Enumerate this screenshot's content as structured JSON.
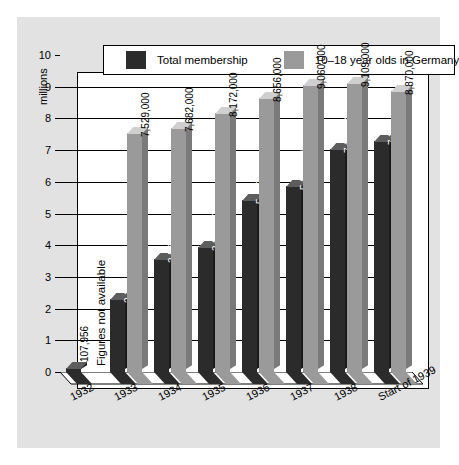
{
  "chart_data": {
    "type": "bar",
    "title": "",
    "subtitle": "",
    "xlabel": "",
    "ylabel": "millions",
    "ylim": [
      0,
      10
    ],
    "yticks": [
      0,
      1,
      2,
      3,
      4,
      5,
      6,
      7,
      8,
      9,
      10
    ],
    "ytick_labels": [
      "0",
      "1",
      "2",
      "3",
      "4",
      "5",
      "6",
      "7",
      "8",
      "9",
      "10"
    ],
    "grid": true,
    "legend_position": "top",
    "categories": [
      "1932",
      "1933",
      "1934",
      "1935",
      "1936",
      "1937",
      "1938",
      "Start of 1939"
    ],
    "series": [
      {
        "name": "Total  membership",
        "color": "#2b2b2b",
        "values": [
          107956,
          2292041,
          3577565,
          3943303,
          5437601,
          5879955,
          7031226,
          7287470
        ],
        "labels": [
          "107,956",
          "2,292,041",
          "3,577,565",
          "3,943,303",
          "5,437,601",
          "5,879,955",
          "7,031,226",
          "7,287,470"
        ]
      },
      {
        "name": "10–18 year olds in Germany",
        "color": "#9a9a9a",
        "values": [
          null,
          7529000,
          7682000,
          8172000,
          8656000,
          9060000,
          9109000,
          8870000
        ],
        "labels": [
          "",
          "7,529,000",
          "7,682,000",
          "8,172,000",
          "8,656,000",
          "9,060,000",
          "9,109,000",
          "8,870,000"
        ]
      }
    ],
    "annotations": [
      {
        "text": "Figures not available",
        "category": "1932",
        "series": "10–18 year olds in Germany"
      }
    ]
  },
  "legend": {
    "entries": [
      {
        "label": "Total  membership",
        "swatch": "dark"
      },
      {
        "label": "10–18 year olds in Germany",
        "swatch": "grey"
      }
    ]
  },
  "colors": {
    "panel": "#e2e2e2",
    "plot_background": "#ffffff",
    "axis": "#000000",
    "series_dark": "#2b2b2b",
    "series_grey": "#9a9a9a"
  }
}
